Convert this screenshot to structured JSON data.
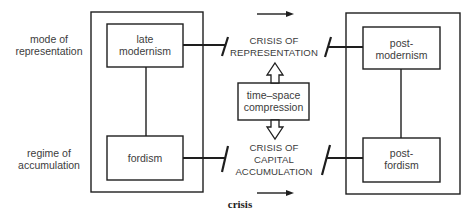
{
  "diagram": {
    "row_labels": [
      {
        "lines": [
          "mode of",
          "representation"
        ]
      },
      {
        "lines": [
          "regime of",
          "accumulation"
        ]
      }
    ],
    "left_block": {
      "upper": {
        "lines": [
          "late",
          "modernism"
        ]
      },
      "lower": {
        "lines": [
          "fordism"
        ]
      }
    },
    "right_block": {
      "upper": {
        "lines": [
          "post-",
          "modernism"
        ]
      },
      "lower": {
        "lines": [
          "post-",
          "fordism"
        ]
      }
    },
    "crises": {
      "upper": {
        "lines": [
          "CRISIS OF",
          "REPRESENTATION"
        ]
      },
      "lower": {
        "lines": [
          "CRISIS OF",
          "CAPITAL",
          "ACCUMULATION"
        ]
      }
    },
    "mediator": {
      "lines": [
        "time–space",
        "compression"
      ]
    },
    "footer_label": "crisis",
    "icons": {
      "top_arrow": "right-arrow-icon",
      "bottom_arrow": "right-arrow-icon",
      "up_arrow": "hollow-up-arrow-icon",
      "down_arrow": "hollow-down-arrow-icon"
    },
    "colors": {
      "line": "#1e1e1e",
      "text": "#3c3c3c",
      "background": "#ffffff"
    }
  }
}
